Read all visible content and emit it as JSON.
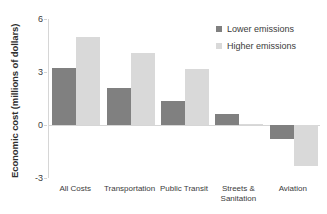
{
  "chart_data": {
    "type": "bar",
    "title": "",
    "xlabel": "",
    "ylabel": "Economic cost (millions of dollars)",
    "categories": [
      "All Costs",
      "Transportation",
      "Public Transit",
      "Streets &\nSanitation",
      "Aviation"
    ],
    "series": [
      {
        "name": "Lower emissions",
        "color": "#808080",
        "values": [
          3.2,
          2.1,
          1.35,
          0.65,
          -0.8
        ]
      },
      {
        "name": "Higher emissions",
        "color": "#d9d9d9",
        "values": [
          5.0,
          4.1,
          3.15,
          0.05,
          -2.3
        ]
      }
    ],
    "ylim": [
      -3,
      6
    ],
    "yticks": [
      "6",
      "3",
      "0",
      "-3"
    ],
    "ytick_values": [
      6,
      3,
      0,
      -3
    ],
    "grid": false,
    "legend_position": "top-right"
  },
  "legend": {
    "items": [
      {
        "label": "Lower emissions"
      },
      {
        "label": "Higher emissions"
      }
    ]
  }
}
